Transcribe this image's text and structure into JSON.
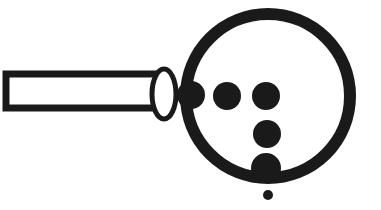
{
  "figure": {
    "alt_text": "Magnifying glass illustration with six black dots",
    "background_color": "#ffffff",
    "ink_color": "#1a1a1a",
    "width": 381,
    "height": 210
  },
  "parts": {
    "handle": {
      "label": "handle",
      "x": 6,
      "y": 74,
      "width": 158,
      "height": 34,
      "stroke_width": 7,
      "fill": "#ffffff",
      "stroke": "#1a1a1a"
    },
    "ferrule": {
      "label": "ferrule",
      "cx": 164,
      "cy": 94,
      "rx": 12,
      "ry": 25,
      "stroke_width": 5,
      "fill": "#ffffff",
      "stroke": "#1a1a1a"
    },
    "lens_rim": {
      "label": "lens rim",
      "cx": 268,
      "cy": 96,
      "r": 82,
      "stroke_width": 12,
      "fill": "none",
      "stroke": "#1a1a1a"
    }
  },
  "dots": [
    {
      "name": "dot-1",
      "cx": 191,
      "cy": 95,
      "r": 14,
      "fill": "#1a1a1a",
      "position": "top-row-left"
    },
    {
      "name": "dot-2",
      "cx": 227,
      "cy": 96,
      "r": 14,
      "fill": "#1a1a1a",
      "position": "top-row-middle"
    },
    {
      "name": "dot-3",
      "cx": 266,
      "cy": 96,
      "r": 14,
      "fill": "#1a1a1a",
      "position": "top-row-right"
    },
    {
      "name": "dot-4",
      "cx": 267,
      "cy": 134,
      "r": 14,
      "fill": "#1a1a1a",
      "position": "middle"
    },
    {
      "name": "dot-5",
      "cx": 266,
      "cy": 168,
      "r": 15,
      "fill": "#1a1a1a",
      "position": "bottom-on-rim"
    },
    {
      "name": "dot-6",
      "cx": 268,
      "cy": 195,
      "r": 5,
      "fill": "#1a1a1a",
      "position": "below-lens"
    }
  ],
  "counts": {
    "dot_count": 6,
    "dot_count_label": "6"
  }
}
